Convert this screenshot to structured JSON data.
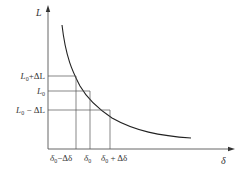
{
  "diagram": {
    "type": "curve-with-intervals",
    "axes": {
      "y_label": "L",
      "x_label": "δ"
    },
    "y_ticks": [
      {
        "base": "L",
        "sub": "0",
        "suffix": "+ΔL"
      },
      {
        "base": "L",
        "sub": "0",
        "suffix": ""
      },
      {
        "base": "L",
        "sub": "0",
        "suffix": " − ΔL"
      }
    ],
    "x_ticks": [
      {
        "base": "δ",
        "sub": "0",
        "suffix": "−Δδ"
      },
      {
        "base": "δ",
        "sub": "0",
        "suffix": ""
      },
      {
        "base": "δ",
        "sub": "0",
        "suffix": " + Δδ"
      }
    ],
    "colors": {
      "line": "#333333",
      "curve": "#222222",
      "background": "#ffffff"
    }
  }
}
